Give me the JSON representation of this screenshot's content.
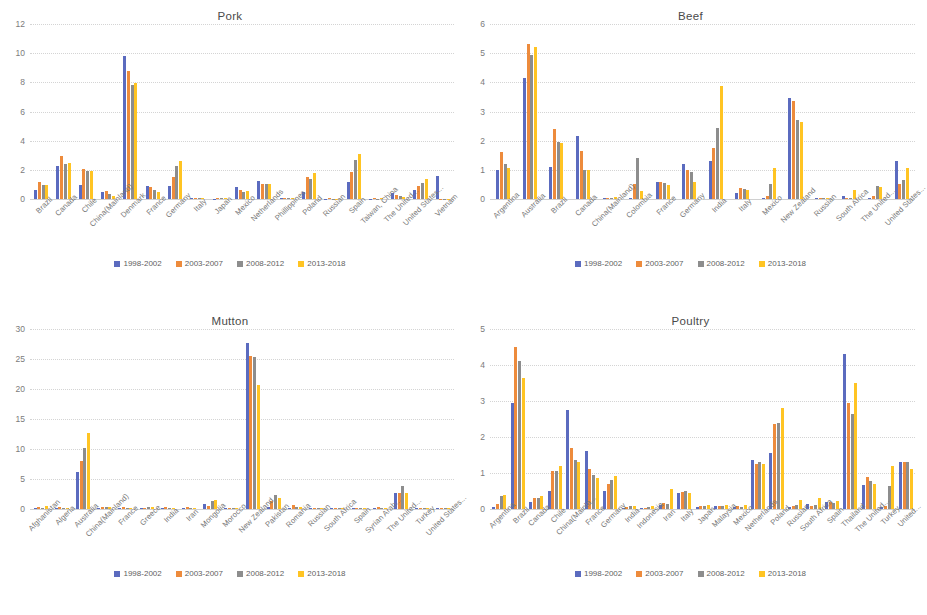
{
  "series_colors": [
    "#5b6bbf",
    "#ed8b3c",
    "#8d8d8d",
    "#ffc423"
  ],
  "legend": {
    "items": [
      "1998-2002",
      "2003-2007",
      "2008-2012",
      "2013-2018"
    ]
  },
  "panels": [
    {
      "id": "pork",
      "title": "Pork"
    },
    {
      "id": "beef",
      "title": "Beef"
    },
    {
      "id": "mutton",
      "title": "Mutton"
    },
    {
      "id": "poultry",
      "title": "Poultry"
    }
  ],
  "chart_data": [
    {
      "type": "bar",
      "title": "Pork",
      "xlabel": "",
      "ylabel": "",
      "ylim": [
        0,
        12
      ],
      "yticks": [
        0,
        2,
        4,
        6,
        8,
        10,
        12
      ],
      "grid": true,
      "legend_position": "bottom",
      "categories": [
        "Brazil",
        "Canada",
        "Chile",
        "China(Mainland)",
        "Denmark",
        "France",
        "Germany",
        "Italy",
        "Japan",
        "Mexico",
        "Netherlands",
        "Phillippines",
        "Poland",
        "Russian",
        "Spain",
        "Taiwan, China",
        "The United...",
        "United States...",
        "Vietnam"
      ],
      "series": [
        {
          "name": "1998-2002",
          "values": [
            0.65,
            2.25,
            0.95,
            0.45,
            9.8,
            0.9,
            0.9,
            0.05,
            0.03,
            0.8,
            1.25,
            0.05,
            0.45,
            0.03,
            1.2,
            0.02,
            0.4,
            0.65,
            1.6
          ]
        },
        {
          "name": "2003-2007",
          "values": [
            1.15,
            2.95,
            2.05,
            0.55,
            8.75,
            0.85,
            1.5,
            0.1,
            0.05,
            0.65,
            1.05,
            0.1,
            1.5,
            0.05,
            1.85,
            0.05,
            0.3,
            0.9,
            0.0
          ]
        },
        {
          "name": "2008-2012",
          "values": [
            0.95,
            2.4,
            1.9,
            0.35,
            7.8,
            0.65,
            2.25,
            0.08,
            0.05,
            0.5,
            1.0,
            0.08,
            1.4,
            0.03,
            2.65,
            0.03,
            0.2,
            1.1,
            0.0
          ]
        },
        {
          "name": "2013-2018",
          "values": [
            0.95,
            2.5,
            1.95,
            0.2,
            7.95,
            0.5,
            2.6,
            0.05,
            0.05,
            0.55,
            1.0,
            0.05,
            1.8,
            0.03,
            3.1,
            0.1,
            0.15,
            1.35,
            0.0
          ]
        }
      ]
    },
    {
      "type": "bar",
      "title": "Beef",
      "xlabel": "",
      "ylabel": "",
      "ylim": [
        0,
        6
      ],
      "yticks": [
        0,
        1,
        2,
        3,
        4,
        5,
        6
      ],
      "grid": true,
      "legend_position": "bottom",
      "categories": [
        "Argentina",
        "Australia",
        "Brazil",
        "Canada",
        "China(Mainland)",
        "Colombia",
        "France",
        "Germany",
        "India",
        "Italy",
        "Mexico",
        "New Zealand",
        "Russian",
        "South Africa",
        "The United...",
        "United States..."
      ],
      "series": [
        {
          "name": "1998-2002",
          "values": [
            1.0,
            4.15,
            1.1,
            2.15,
            0.05,
            0.05,
            0.6,
            1.2,
            1.3,
            0.22,
            0.03,
            3.45,
            0.03,
            0.12,
            0.03,
            1.3
          ]
        },
        {
          "name": "2003-2007",
          "values": [
            1.6,
            5.3,
            2.4,
            1.65,
            0.04,
            0.5,
            0.6,
            0.98,
            1.75,
            0.38,
            0.12,
            3.35,
            0.05,
            0.05,
            0.12,
            0.5
          ]
        },
        {
          "name": "2008-2012",
          "values": [
            1.2,
            4.95,
            1.95,
            1.0,
            0.03,
            1.4,
            0.55,
            0.92,
            2.45,
            0.35,
            0.5,
            2.7,
            0.04,
            0.03,
            0.45,
            0.65
          ]
        },
        {
          "name": "2013-2018",
          "values": [
            1.05,
            5.2,
            1.92,
            1.0,
            0.07,
            0.28,
            0.48,
            0.6,
            3.88,
            0.32,
            1.05,
            2.65,
            0.03,
            0.3,
            0.4,
            1.05
          ]
        }
      ]
    },
    {
      "type": "bar",
      "title": "Mutton",
      "xlabel": "",
      "ylabel": "",
      "ylim": [
        0,
        30
      ],
      "yticks": [
        0,
        5,
        10,
        15,
        20,
        25,
        30
      ],
      "grid": true,
      "legend_position": "bottom",
      "categories": [
        "Afghanistan",
        "Algeria",
        "Australia",
        "China(Mainland)",
        "France",
        "Greece",
        "India",
        "Iran",
        "Mongolia",
        "Morocco",
        "New Zealand",
        "Pakistan",
        "Romania",
        "Russian",
        "South Africa",
        "Spain",
        "Syrian Arab...",
        "The United...",
        "Turkey",
        "United States..."
      ],
      "series": [
        {
          "name": "1998-2002",
          "values": [
            0.1,
            0.2,
            6.1,
            0.2,
            0.25,
            0.2,
            0.2,
            0.2,
            0.9,
            0.1,
            27.6,
            0.3,
            0.1,
            0.2,
            0.2,
            0.15,
            0.1,
            2.7,
            0.2,
            0.15
          ]
        },
        {
          "name": "2003-2007",
          "values": [
            0.3,
            0.3,
            8.0,
            0.35,
            0.3,
            0.25,
            0.3,
            0.3,
            0.5,
            0.15,
            25.5,
            1.3,
            0.6,
            0.25,
            0.2,
            0.15,
            0.3,
            2.6,
            0.25,
            0.2
          ]
        },
        {
          "name": "2008-2012",
          "values": [
            0.2,
            0.25,
            10.1,
            0.3,
            0.25,
            0.3,
            0.25,
            0.2,
            1.3,
            0.15,
            25.4,
            2.4,
            0.3,
            0.2,
            0.25,
            0.1,
            0.2,
            3.9,
            0.2,
            0.2
          ]
        },
        {
          "name": "2013-2018",
          "values": [
            0.5,
            0.2,
            12.6,
            0.4,
            0.25,
            0.3,
            0.25,
            0.25,
            1.5,
            0.15,
            20.7,
            1.8,
            0.4,
            0.2,
            0.2,
            0.15,
            0.15,
            2.7,
            0.25,
            0.2
          ]
        }
      ]
    },
    {
      "type": "bar",
      "title": "Poultry",
      "xlabel": "",
      "ylabel": "",
      "ylim": [
        0,
        5
      ],
      "yticks": [
        0,
        1,
        2,
        3,
        4,
        5
      ],
      "grid": true,
      "legend_position": "bottom",
      "categories": [
        "Argentina",
        "Brazil",
        "Canada",
        "Chile",
        "China(Mainla...",
        "France",
        "Germany",
        "India",
        "Indonesia",
        "Iran",
        "Italy",
        "Japan",
        "Malaysia",
        "Mexico",
        "Netherlands",
        "Poland",
        "Russian",
        "South Africa",
        "Spain",
        "Thailand",
        "The United...",
        "Turkey",
        "United..."
      ],
      "series": [
        {
          "name": "1998-2002",
          "values": [
            0.05,
            2.95,
            0.2,
            0.5,
            2.75,
            1.6,
            0.5,
            0.03,
            0.02,
            0.1,
            0.45,
            0.06,
            0.07,
            0.05,
            1.35,
            1.55,
            0.05,
            0.15,
            0.2,
            4.3,
            0.68,
            0.05,
            1.3
          ]
        },
        {
          "name": "2003-2007",
          "values": [
            0.15,
            4.5,
            0.3,
            1.05,
            1.7,
            1.1,
            0.7,
            0.06,
            0.03,
            0.18,
            0.48,
            0.08,
            0.08,
            0.07,
            1.25,
            2.35,
            0.08,
            0.07,
            0.2,
            2.95,
            0.9,
            0.07,
            1.3
          ]
        },
        {
          "name": "2008-2012",
          "values": [
            0.35,
            4.1,
            0.3,
            1.05,
            1.35,
            0.95,
            0.8,
            0.07,
            0.05,
            0.15,
            0.5,
            0.07,
            0.07,
            0.06,
            1.3,
            2.4,
            0.1,
            0.1,
            0.18,
            2.65,
            0.78,
            0.65,
            1.3
          ]
        },
        {
          "name": "2013-2018",
          "values": [
            0.4,
            3.65,
            0.35,
            1.2,
            1.3,
            0.85,
            0.92,
            0.08,
            0.07,
            0.55,
            0.45,
            0.1,
            0.12,
            0.1,
            1.25,
            2.8,
            0.25,
            0.3,
            0.22,
            3.5,
            0.7,
            1.2,
            1.1
          ]
        }
      ]
    }
  ]
}
